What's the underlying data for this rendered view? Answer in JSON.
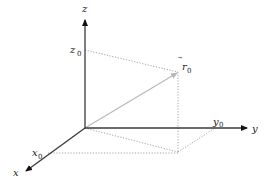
{
  "diagram": {
    "type": "3d-coordinate-system",
    "axes": {
      "x": {
        "label": "x"
      },
      "y": {
        "label": "y"
      },
      "z": {
        "label": "z"
      }
    },
    "components": {
      "x0": {
        "label": "x",
        "sub": "0"
      },
      "y0": {
        "label": "y",
        "sub": "0"
      },
      "z0": {
        "label": "z",
        "sub": "0"
      }
    },
    "vector": {
      "label": "r",
      "sub": "0",
      "accent": "⃗"
    },
    "colors": {
      "axis": "#3a3a3a",
      "vector": "#b8b8b8",
      "dotted": "#9a9a9a"
    }
  }
}
